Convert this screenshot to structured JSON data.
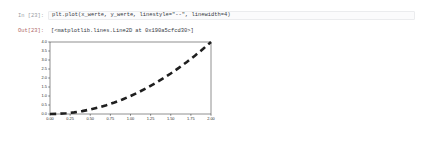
{
  "notebook": {
    "input_cell": {
      "prompt": "In [23]:",
      "code": "plt.plot(x_werte, y_werte, linestyle=\"--\", linewidth=4)"
    },
    "output_cell": {
      "prompt": "Out[23]:",
      "text": "[<matplotlib.lines.Line2D at 0x190a5cfcd30>]"
    }
  },
  "chart_data": {
    "type": "line",
    "title": "",
    "xlabel": "",
    "ylabel": "",
    "xlim": [
      0.0,
      2.0
    ],
    "ylim": [
      0.0,
      4.0
    ],
    "grid": false,
    "legend": null,
    "xticks": [
      "0.00",
      "0.25",
      "0.50",
      "0.75",
      "1.00",
      "1.25",
      "1.50",
      "1.75",
      "2.00"
    ],
    "yticks": [
      "0.0",
      "0.5",
      "1.0",
      "1.5",
      "2.0",
      "2.5",
      "3.0",
      "3.5",
      "4.0"
    ],
    "series": [
      {
        "name": "y_werte",
        "linestyle": "--",
        "linewidth": 4,
        "color": "#1f1f1f",
        "x": [
          0.0,
          0.1,
          0.2,
          0.3,
          0.4,
          0.5,
          0.6,
          0.7,
          0.8,
          0.9,
          1.0,
          1.1,
          1.2,
          1.3,
          1.4,
          1.5,
          1.6,
          1.7,
          1.8,
          1.9,
          2.0
        ],
        "values": [
          0.0,
          0.01,
          0.04,
          0.09,
          0.16,
          0.25,
          0.36,
          0.49,
          0.64,
          0.81,
          1.0,
          1.21,
          1.44,
          1.69,
          1.96,
          2.25,
          2.56,
          2.89,
          3.24,
          3.61,
          4.0
        ]
      }
    ]
  },
  "colors": {
    "axis": "#222222",
    "tick_label": "#2b2b2b",
    "line": "#1f1f1f",
    "code_border": "#ebecee",
    "prompt": "#999da3"
  }
}
